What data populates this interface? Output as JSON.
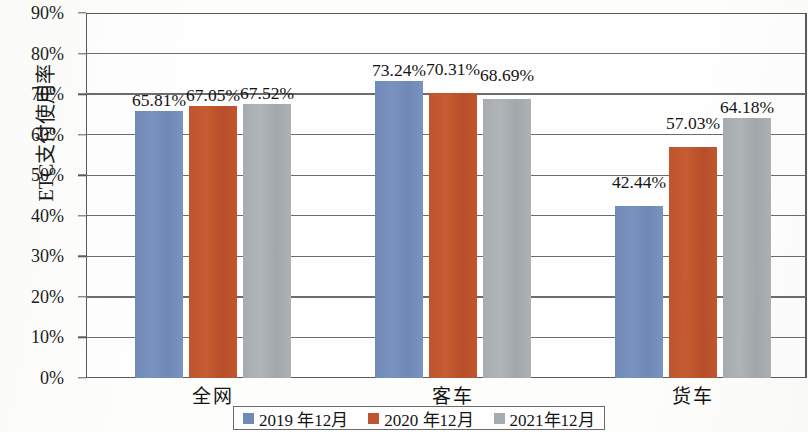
{
  "chart_data": {
    "type": "bar",
    "title": "",
    "xlabel": "",
    "ylabel": "ETC支付使用率",
    "categories": [
      "全网",
      "客车",
      "货车"
    ],
    "series": [
      {
        "name": "2019 年12月",
        "color": "#7089b8",
        "values": [
          65.81,
          73.24,
          42.44
        ],
        "labels": [
          "65.81%",
          "73.24%",
          "42.44%"
        ]
      },
      {
        "name": "2020 年12月",
        "color": "#bf5430",
        "values": [
          67.05,
          70.31,
          57.03
        ],
        "labels": [
          "67.05%",
          "70.31%",
          "57.03%"
        ]
      },
      {
        "name": "2021年12月",
        "color": "#a7acb0",
        "values": [
          67.52,
          68.69,
          64.18
        ],
        "labels": [
          "67.52%",
          "68.69%",
          "64.18%"
        ]
      }
    ],
    "ylim": [
      0,
      90
    ],
    "ytick_values": [
      0,
      10,
      20,
      30,
      40,
      50,
      60,
      70,
      80,
      90
    ],
    "ytick_labels": [
      "0%",
      "10%",
      "20%",
      "30%",
      "40%",
      "50%",
      "60%",
      "70%",
      "80%",
      "90%"
    ],
    "grid": true,
    "legend_position": "bottom"
  }
}
